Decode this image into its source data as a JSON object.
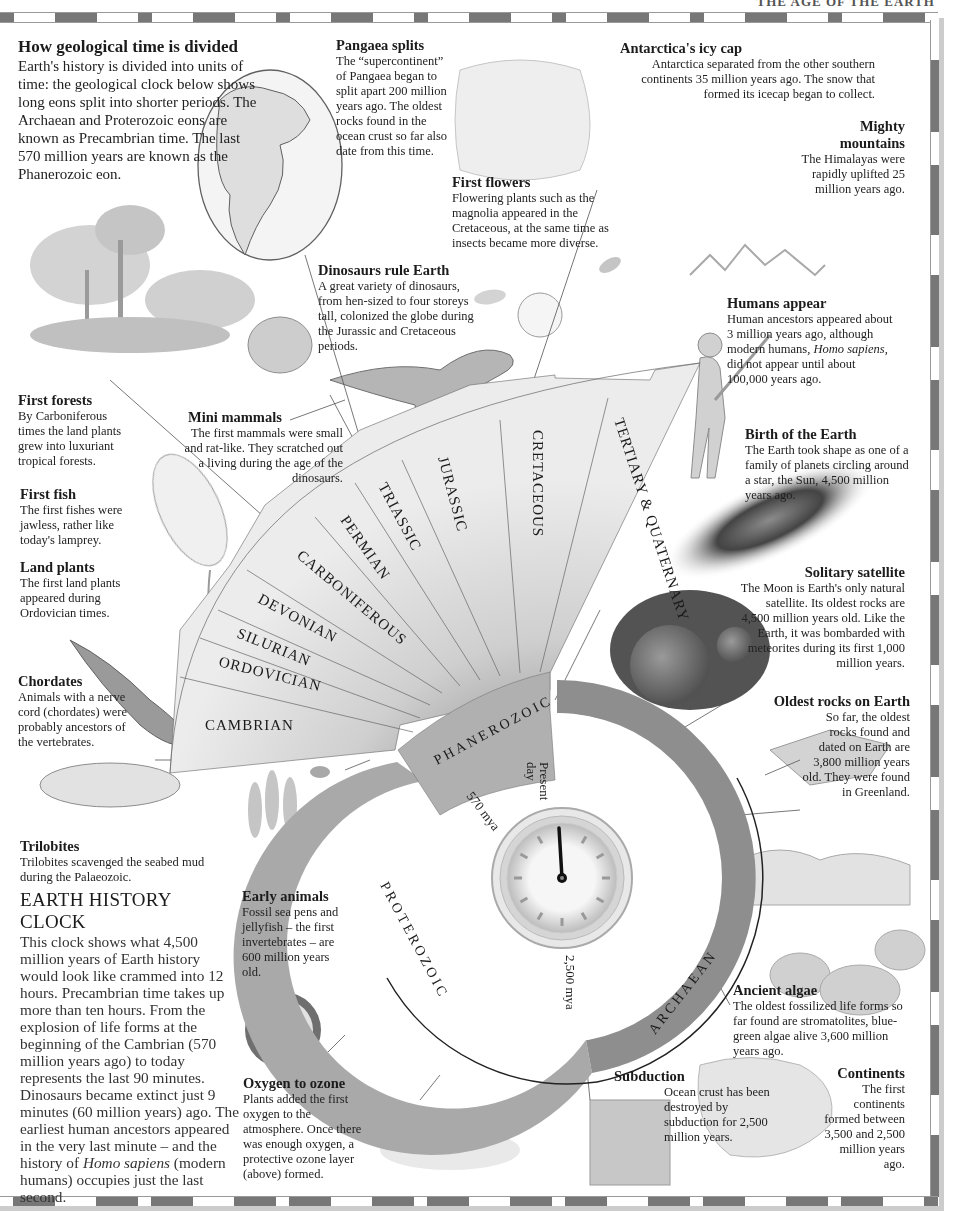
{
  "header": {
    "running_title": "THE AGE OF THE EARTH"
  },
  "intro": {
    "title": "How geological time is divided",
    "body": "Earth's history is divided into units of time: the geological clock below shows long eons split into shorter periods. The Archaean and Proterozoic eons are known as Precambrian time. The last 570 million years are known as the Phanerozoic eon."
  },
  "callouts": {
    "pangaea": {
      "title": "Pangaea splits",
      "body": "The “supercontinent” of Pangaea began to split apart 200 million years ago. The oldest rocks found in the ocean crust so far also date from this time."
    },
    "antarctica": {
      "title": "Antarctica's icy cap",
      "body": "Antarctica separated from the other southern continents 35 million years ago. The snow that formed its icecap began to collect."
    },
    "mountains": {
      "title": "Mighty mountains",
      "body": "The Himalayas were rapidly uplifted 25 million years ago."
    },
    "flowers": {
      "title": "First flowers",
      "body": "Flowering plants such as the magnolia appeared in the Cretaceous, at the same time as insects became more diverse."
    },
    "dinosaurs": {
      "title": "Dinosaurs rule Earth",
      "body": "A great variety of dinosaurs, from hen-sized to four storeys tall, colonized the globe during the Jurassic and Cretaceous periods."
    },
    "humans": {
      "title": "Humans appear",
      "body_1": "Human ancestors appeared about 3 million years ago, although modern humans,",
      "body_italic": "Homo sapiens",
      "body_2": ", did not appear until about 100,000 years ago."
    },
    "forests": {
      "title": "First forests",
      "body": "By Carboniferous times the land plants grew into luxuriant tropical forests."
    },
    "mammals": {
      "title": "Mini mammals",
      "body": "The first mammals were small and rat-like. They scratched out a living during the age of the dinosaurs."
    },
    "birth": {
      "title": "Birth of the Earth",
      "body": "The Earth took shape as one of a family of planets circling around a star, the Sun, 4,500 million years ago."
    },
    "fish": {
      "title": "First fish",
      "body": "The first fishes were jawless, rather like today's lamprey."
    },
    "land_plants": {
      "title": "Land plants",
      "body": "The first land plants appeared during Ordovician times."
    },
    "satellite": {
      "title": "Solitary satellite",
      "body": "The Moon is Earth's only natural satellite. Its oldest rocks are 4,500 million years old. Like the Earth, it was bombarded with meteorites during its first 1,000 million years."
    },
    "chordates": {
      "title": "Chordates",
      "body": "Animals with a nerve cord (chordates) were probably ancestors of the vertebrates."
    },
    "oldest_rocks": {
      "title": "Oldest rocks on Earth",
      "body": "So far, the oldest rocks found and dated on Earth are 3,800 million years old. They were found in Greenland."
    },
    "trilobites": {
      "title": "Trilobites",
      "body": "Trilobites scavenged the seabed mud during the Palaeozoic."
    },
    "early_animals": {
      "title": "Early animals",
      "body": "Fossil sea pens and jellyfish – the first invertebrates – are 600 million years old."
    },
    "algae": {
      "title": "Ancient algae",
      "body": "The oldest fossilized life forms so far found are stromatolites, blue-green algae alive 3,600 million years ago."
    },
    "oxygen": {
      "title": "Oxygen to ozone",
      "body": "Plants added the first oxygen to the atmosphere. Once there was enough oxygen, a protective ozone layer (above) formed."
    },
    "subduction": {
      "title": "Subduction",
      "body": "Ocean crust has been destroyed by subduction for 2,500 million years."
    },
    "continents": {
      "title": "Continents",
      "body": "The first continents formed between 3,500 and 2,500 million years ago."
    }
  },
  "clock_text": {
    "title": "EARTH HISTORY CLOCK",
    "body_1": "This clock shows what 4,500 million years of Earth history would look like crammed into 12 hours. Precambrian time takes up more than ten hours. From the explosion of life forms at the beginning of the Cambrian (570 million years ago) to today represents the last 90 minutes. Dinosaurs became extinct just 9 minutes (60 million years) ago. The earliest human ancestors appeared in the very last minute – and the history of ",
    "body_italic": "Homo sapiens",
    "body_2": " (modern humans) occupies just the last second."
  },
  "diagram": {
    "periods": [
      "CAMBRIAN",
      "ORDOVICIAN",
      "SILURIAN",
      "DEVONIAN",
      "CARBONIFEROUS",
      "PERMIAN",
      "TRIASSIC",
      "JURASSIC",
      "CRETACEOUS",
      "TERTIARY & QUATERNARY"
    ],
    "eons": {
      "phanerozoic": "PHANEROZOIC",
      "proterozoic": "PROTEROZOIC",
      "archaean": "ARCHAEAN"
    },
    "markers": {
      "present_line1": "Present",
      "present_line2": "day",
      "mya_570": "570 mya",
      "mya_2500": "2,500 mya"
    }
  }
}
